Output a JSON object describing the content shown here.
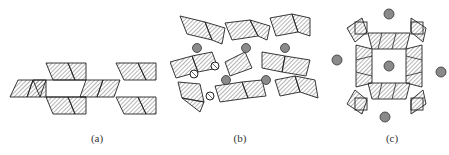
{
  "figure": {
    "panels": [
      {
        "id": "a",
        "label": "(a)",
        "description": "chain of edge-sharing hatched octahedra (ribbon)"
      },
      {
        "id": "b",
        "label": "(b)",
        "description": "framework of corner-sharing hatched polyhedra with gray cations and circled anions"
      },
      {
        "id": "c",
        "label": "(c)",
        "description": "square ring of hatched polyhedra with central and surrounding gray cations"
      }
    ],
    "colors": {
      "outline": "#222222",
      "hatch": "#444444",
      "cation_fill": "#8a8a8a",
      "cation_stroke": "#333333",
      "background": "#ffffff"
    }
  }
}
